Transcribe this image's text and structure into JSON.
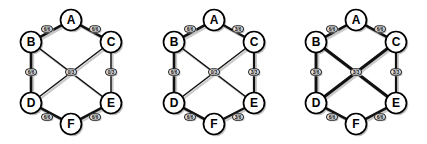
{
  "figure": {
    "background_color": "#ffffff",
    "node_fill": "#ffffff",
    "node_stroke": "#000000",
    "edge_color": "#111111",
    "label_box_fill": "#e8e8e8",
    "shadow_color": "#c0c0c0",
    "panel_count": 3
  },
  "nodes": [
    {
      "id": "A",
      "label": "A",
      "x": 71,
      "y": 20
    },
    {
      "id": "B",
      "label": "B",
      "x": 31,
      "y": 42
    },
    {
      "id": "C",
      "label": "C",
      "x": 111,
      "y": 42
    },
    {
      "id": "D",
      "label": "D",
      "x": 31,
      "y": 103
    },
    {
      "id": "E",
      "label": "E",
      "x": 111,
      "y": 103
    },
    {
      "id": "F",
      "label": "F",
      "x": 71,
      "y": 124
    }
  ],
  "node_radius": 10.5,
  "edges": [
    {
      "id": "AB",
      "from": "B",
      "to": "A",
      "label_x": 47,
      "label_y": 29
    },
    {
      "id": "AC",
      "from": "A",
      "to": "C",
      "label_x": 95,
      "label_y": 29
    },
    {
      "id": "BD",
      "from": "B",
      "to": "D",
      "label_x": 31,
      "label_y": 72
    },
    {
      "id": "CE",
      "from": "C",
      "to": "E",
      "label_x": 111,
      "label_y": 72
    },
    {
      "id": "BE",
      "from": "B",
      "to": "E",
      "label_x": 71,
      "label_y": 72
    },
    {
      "id": "CD",
      "from": "C",
      "to": "D",
      "label_x": 71,
      "label_y": 72
    },
    {
      "id": "DF",
      "from": "D",
      "to": "F",
      "label_x": 47,
      "label_y": 117
    },
    {
      "id": "EF",
      "from": "F",
      "to": "E",
      "label_x": 95,
      "label_y": 117
    }
  ],
  "panels": [
    {
      "id": "graph-1",
      "name": "graph-panel-1",
      "edge_labels": {
        "AB": "6/6",
        "AC": "6/6",
        "BD": "6/6",
        "CE": "0/3",
        "BE": "0/3",
        "CD": "0/3",
        "DF": "6/6",
        "EF": "6/6"
      },
      "edge_widths": {
        "AB": 2.6,
        "AC": 2.6,
        "BD": 2.6,
        "CE": 1.5,
        "BE": 1.5,
        "CD": 1.5,
        "DF": 2.6,
        "EF": 2.6
      },
      "center_label": "0/3"
    },
    {
      "id": "graph-2",
      "name": "graph-panel-2",
      "edge_labels": {
        "AB": "6/6",
        "AC": "3/6",
        "BD": "6/6",
        "CE": "3/3",
        "BE": "0/3",
        "CD": "0/3",
        "DF": "6/6",
        "EF": "3/6"
      },
      "edge_widths": {
        "AB": 2.6,
        "AC": 2.2,
        "BD": 2.6,
        "CE": 2.2,
        "BE": 1.5,
        "CD": 1.5,
        "DF": 2.6,
        "EF": 2.2
      },
      "center_label": "0/3"
    },
    {
      "id": "graph-3",
      "name": "graph-panel-3",
      "edge_labels": {
        "AB": "6/6",
        "AC": "6/6",
        "BD": "3/6",
        "CE": "3/3",
        "BE": "3/3",
        "CD": "3/3",
        "DF": "6/6",
        "EF": "6/6"
      },
      "edge_widths": {
        "AB": 2.6,
        "AC": 2.6,
        "BD": 2.9,
        "CE": 2.2,
        "BE": 2.9,
        "CD": 2.9,
        "DF": 2.6,
        "EF": 2.6
      },
      "center_label": "3/3"
    }
  ]
}
